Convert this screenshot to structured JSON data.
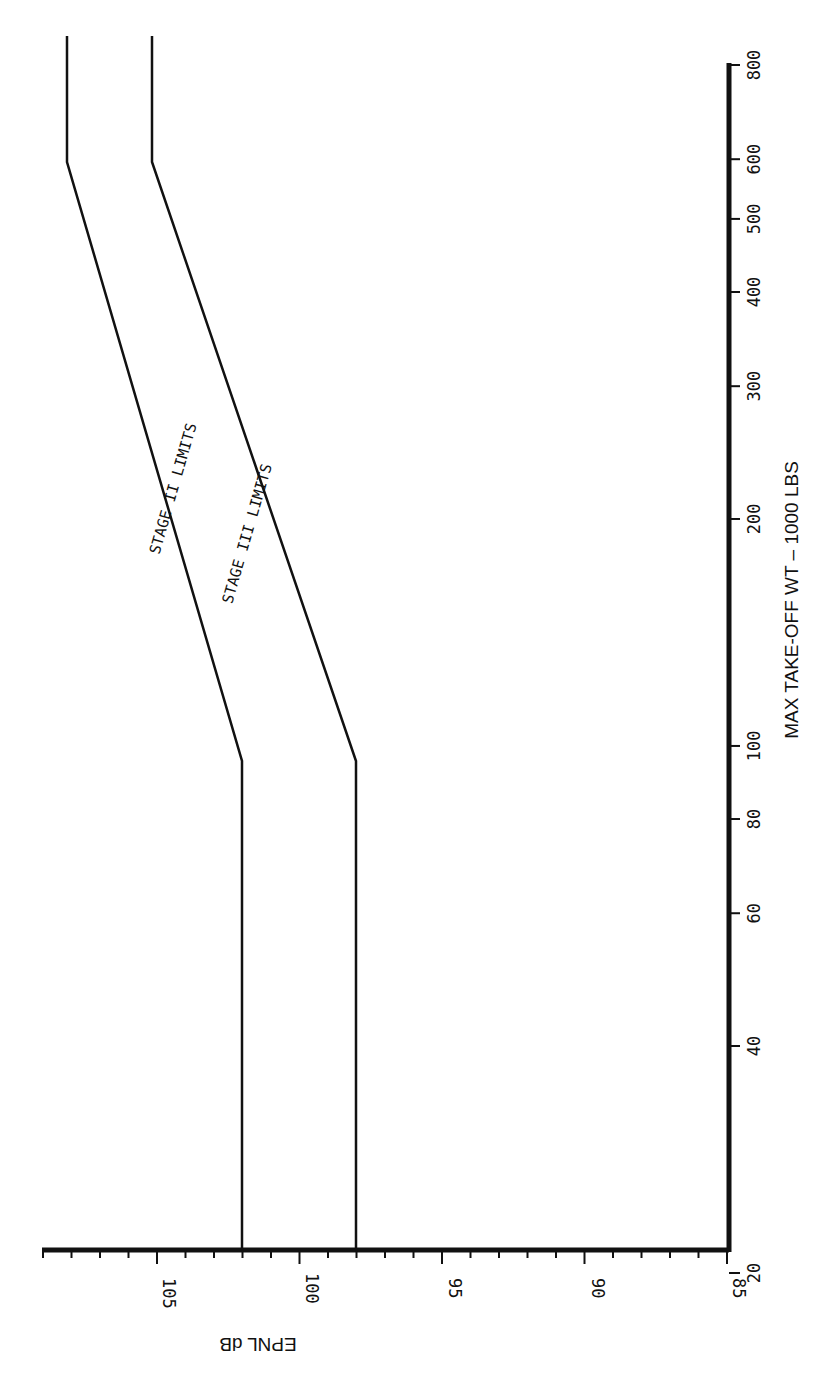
{
  "chart_data": {
    "type": "line",
    "orientation": "rotated-90-ccw",
    "title": "",
    "xlabel": "MAX TAKE-OFF WT – 1000 LBS",
    "ylabel": "EPNL dB",
    "xscale": "log",
    "xlim": [
      20,
      800
    ],
    "ylim": [
      85,
      109
    ],
    "x_ticks": [
      20,
      40,
      60,
      80,
      100,
      200,
      300,
      400,
      500,
      600,
      800
    ],
    "y_ticks": [
      85,
      90,
      95,
      100,
      105
    ],
    "grid": false,
    "series": [
      {
        "name": "STAGE II LIMITS",
        "x": [
          20,
          80,
          610,
          800
        ],
        "values": [
          102,
          102,
          108,
          108
        ]
      },
      {
        "name": "STAGE III LIMITS",
        "x": [
          20,
          80,
          610,
          800
        ],
        "values": [
          98,
          98,
          105,
          105
        ]
      }
    ]
  },
  "labels": {
    "xlabel": "MAX TAKE-OFF WT – 1000 LBS",
    "ylabel": "EPNL dB",
    "stage2": "STAGE II LIMITS",
    "stage3": "STAGE III LIMITS",
    "x_ticks": [
      "20",
      "40",
      "60",
      "80",
      "100",
      "200",
      "300",
      "400",
      "500",
      "600",
      "800"
    ],
    "y_ticks": [
      "85",
      "90",
      "95",
      "100",
      "105"
    ]
  }
}
